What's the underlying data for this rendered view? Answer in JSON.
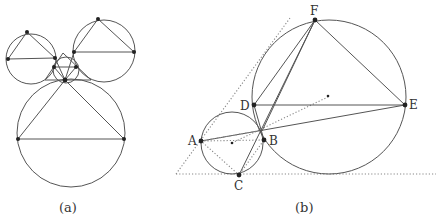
{
  "figure": {
    "panel_a": {
      "caption": "(a)"
    },
    "panel_b": {
      "caption": "(b)",
      "points": {
        "A": "A",
        "B": "B",
        "C": "C",
        "D": "D",
        "E": "E",
        "F": "F"
      }
    }
  }
}
